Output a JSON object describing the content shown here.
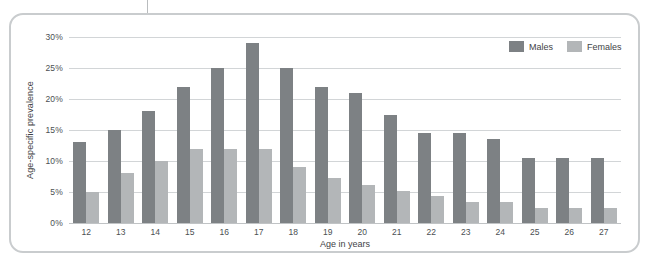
{
  "chart_data": {
    "type": "bar",
    "title": "",
    "xlabel": "Age in years",
    "ylabel": "Age-specific prevalence",
    "categories": [
      "12",
      "13",
      "14",
      "15",
      "16",
      "17",
      "18",
      "19",
      "20",
      "21",
      "22",
      "23",
      "24",
      "25",
      "26",
      "27"
    ],
    "series": [
      {
        "name": "Males",
        "color": "#7d8184",
        "values": [
          13.0,
          15.0,
          18.0,
          22.0,
          25.0,
          29.0,
          25.0,
          22.0,
          21.0,
          17.5,
          14.5,
          14.5,
          13.5,
          10.5,
          10.5,
          10.5
        ]
      },
      {
        "name": "Females",
        "color": "#b3b6b8",
        "values": [
          5.0,
          8.0,
          10.0,
          12.0,
          12.0,
          12.0,
          9.0,
          7.2,
          6.2,
          5.2,
          4.4,
          3.4,
          3.4,
          2.4,
          2.4,
          2.5
        ]
      }
    ],
    "ylim": [
      0,
      30
    ],
    "yticks": [
      0,
      5,
      10,
      15,
      20,
      25,
      30
    ],
    "ytick_labels": [
      "0%",
      "5%",
      "10%",
      "15%",
      "20%",
      "25%",
      "30%"
    ],
    "grid": true,
    "legend_position": "top-right"
  },
  "legend": {
    "items": [
      {
        "label": "Males",
        "swatch": "male-swatch"
      },
      {
        "label": "Females",
        "swatch": "female-swatch"
      }
    ]
  },
  "axes": {
    "y_title": "Age-specific prevalence",
    "x_title": "Age in years"
  },
  "colors": {
    "male_bar": "#7d8184",
    "female_bar": "#b3b6b8",
    "gridline": "#d2d5d7",
    "card_border": "#c9ccce",
    "text": "#3f4346"
  }
}
